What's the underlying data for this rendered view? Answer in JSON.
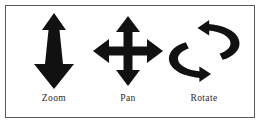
{
  "figure": {
    "background_color": "#ffffff",
    "border_color": "#5a5a5f",
    "glyph_color": "#111111",
    "items": [
      {
        "id": "zoom",
        "label": "Zoom",
        "icon": "vertical-double-arrow-icon",
        "description": "Tapered vertical arrow, small head up and large head down"
      },
      {
        "id": "pan",
        "label": "Pan",
        "icon": "four-way-arrow-icon",
        "description": "Cross with arrowheads up, down, left and right"
      },
      {
        "id": "rotate",
        "label": "Rotate",
        "icon": "circular-rotate-arrows-icon",
        "description": "Two curved arrows forming a circular rotation loop"
      }
    ]
  }
}
